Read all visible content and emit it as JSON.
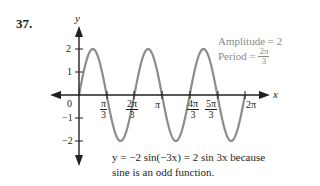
{
  "problem": {
    "number": "37."
  },
  "axes": {
    "x_label": "x",
    "y_label": "y",
    "origin_label": "0",
    "y_ticks": [
      {
        "label": "2",
        "value": 2
      },
      {
        "label": "1",
        "value": 1
      },
      {
        "label": "−1",
        "value": -1
      },
      {
        "label": "−2",
        "value": -2
      }
    ],
    "x_ticks": [
      {
        "num": "π",
        "den": "3",
        "value": "π/3"
      },
      {
        "num": "2π",
        "den": "3",
        "value": "2π/3"
      },
      {
        "label": "π",
        "value": "π"
      },
      {
        "num": "4π",
        "den": "3",
        "value": "4π/3"
      },
      {
        "num": "5π",
        "den": "3",
        "value": "5π/3"
      },
      {
        "label": "2π",
        "value": "2π"
      }
    ]
  },
  "info": {
    "amplitude": "Amplitude = 2",
    "period_prefix": "Period = ",
    "period_num": "2π",
    "period_den": "3"
  },
  "caption": {
    "line1": "y = −2 sin(−3x) = 2 sin 3x because",
    "line2": "sine is an odd function."
  },
  "colors": {
    "curve": "#8c8c8c",
    "axis": "#231f20",
    "info_text": "#8a8a8a"
  },
  "chart_data": {
    "type": "line",
    "title": "",
    "function": "y = 2 sin 3x",
    "xlabel": "x",
    "ylabel": "y",
    "xlim": [
      0,
      6.2832
    ],
    "ylim": [
      -2,
      2
    ],
    "x_tick_labels": [
      "π/3",
      "2π/3",
      "π",
      "4π/3",
      "5π/3",
      "2π"
    ],
    "y_tick_labels": [
      "-2",
      "-1",
      "1",
      "2"
    ],
    "grid": false,
    "series": [
      {
        "name": "y = 2 sin 3x",
        "x": [
          0,
          0.5236,
          1.0472,
          1.5708,
          2.0944,
          2.618,
          3.1416,
          3.6652,
          4.1888,
          4.7124,
          5.236,
          5.7596,
          6.2832
        ],
        "values": [
          0,
          2,
          0,
          -2,
          0,
          2,
          0,
          -2,
          0,
          2,
          0,
          -2,
          0
        ]
      }
    ],
    "annotations": [
      "Amplitude = 2",
      "Period = 2π/3",
      "y = −2 sin(−3x) = 2 sin 3x because sine is an odd function."
    ]
  }
}
